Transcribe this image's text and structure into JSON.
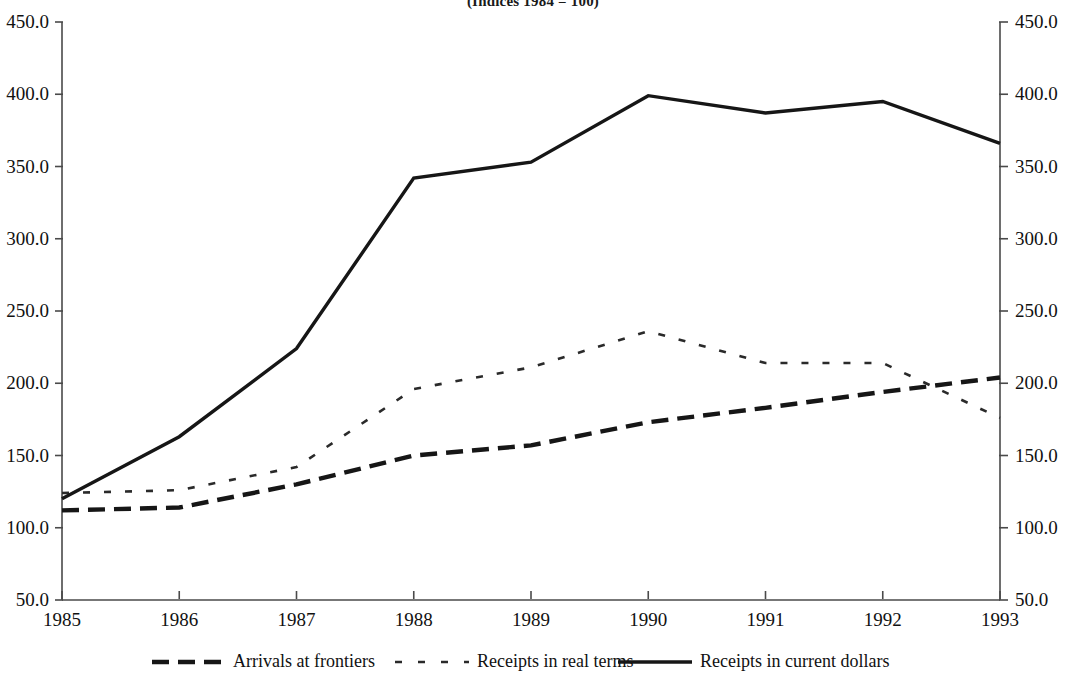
{
  "chart_data": {
    "type": "line",
    "title": "(Indices 1984 = 100)",
    "xlabel": "",
    "ylabel": "",
    "x": [
      1985,
      1986,
      1987,
      1988,
      1989,
      1990,
      1991,
      1992,
      1993
    ],
    "categories": [
      "1985",
      "1986",
      "1987",
      "1988",
      "1989",
      "1990",
      "1991",
      "1992",
      "1993"
    ],
    "series": [
      {
        "name": "Arrivals at frontiers",
        "style": "dashed",
        "values": [
          112,
          114,
          130,
          150,
          157,
          173,
          183,
          194,
          204
        ]
      },
      {
        "name": "Receipts in real terms",
        "style": "dotted",
        "values": [
          124,
          126,
          142,
          196,
          211,
          236,
          214,
          214,
          176
        ]
      },
      {
        "name": "Receipts in current dollars",
        "style": "solid",
        "values": [
          120,
          163,
          224,
          342,
          353,
          399,
          387,
          395,
          366
        ]
      }
    ],
    "ylim": [
      50,
      450
    ],
    "y_ticks": [
      "50.0",
      "100.0",
      "150.0",
      "200.0",
      "250.0",
      "300.0",
      "350.0",
      "400.0",
      "450.0"
    ],
    "y_tick_values": [
      50,
      100,
      150,
      200,
      250,
      300,
      350,
      400,
      450
    ],
    "y_axis_right_ticks": [
      "50.0",
      "100.0",
      "150.0",
      "200.0",
      "250.0",
      "300.0",
      "350.0",
      "400.0",
      "450.0"
    ],
    "grid": false,
    "legend_position": "bottom",
    "dual_axis": true,
    "colors": {
      "axis": "#4a4a4a",
      "line": "#161616",
      "text": "#111111",
      "background": "#ffffff"
    }
  }
}
